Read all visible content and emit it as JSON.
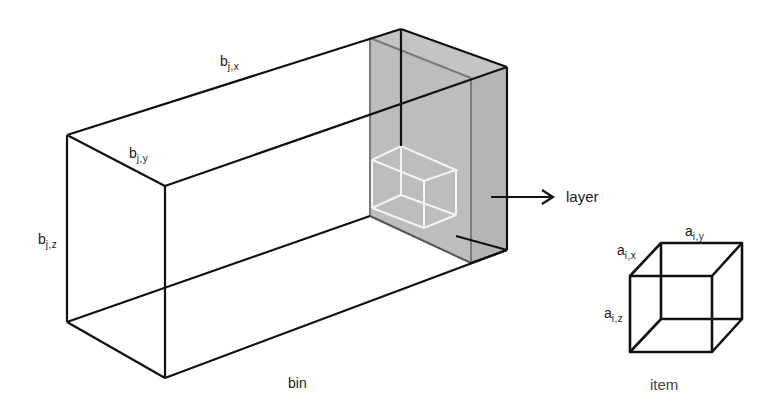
{
  "diagram": {
    "type": "3d-bin-packing-illustration",
    "colors": {
      "edge": "#111111",
      "layer_fill": "#bdbdbd",
      "layer_inner_edge": "#7a7a7a",
      "item_in_layer_edge": "#f2f2f2",
      "background": "#ffffff"
    },
    "bin": {
      "caption": "bin",
      "dims": {
        "x": {
          "base": "b",
          "sub": "j,x"
        },
        "y": {
          "base": "b",
          "sub": "j,y"
        },
        "z": {
          "base": "b",
          "sub": "j,z"
        }
      }
    },
    "layer": {
      "caption": "layer",
      "arrow": "right-arrow"
    },
    "item": {
      "caption": "item",
      "dims": {
        "x": {
          "base": "a",
          "sub": "i,x"
        },
        "y": {
          "base": "a",
          "sub": "i,y"
        },
        "z": {
          "base": "a",
          "sub": "i,z"
        }
      }
    }
  }
}
